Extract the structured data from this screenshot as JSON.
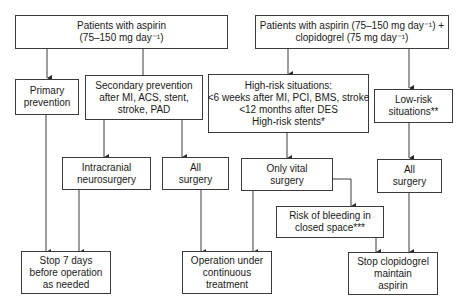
{
  "nodes": {
    "aspirin_root": {
      "lines": [
        "Patients with aspirin",
        "(75–150 mg day⁻¹)"
      ]
    },
    "primary_prevention": {
      "lines": [
        "Primary",
        "prevention"
      ]
    },
    "secondary_prevention": {
      "lines": [
        "Secondary prevention",
        "after MI, ACS, stent,",
        "stroke, PAD"
      ]
    },
    "intracranial": {
      "lines": [
        "Intracranial",
        "neurosurgery"
      ]
    },
    "all_surgery_left": {
      "lines": [
        "All",
        "surgery"
      ]
    },
    "stop_7_days": {
      "lines": [
        "Stop 7 days",
        "before operation",
        "as needed"
      ]
    },
    "operation_continuous": {
      "lines": [
        "Operation under",
        "continuous",
        "treatment"
      ]
    },
    "dual_root": {
      "lines": [
        "Patients with aspirin (75–150 mg day⁻¹) +",
        "clopidogrel (75 mg day⁻¹)"
      ]
    },
    "high_risk": {
      "lines": [
        "High-risk situations:",
        "<6 weeks after MI, PCI, BMS, stroke",
        "<12 months after DES",
        "High-risk stents*"
      ]
    },
    "low_risk": {
      "lines": [
        "Low-risk",
        "situations**"
      ]
    },
    "only_vital": {
      "lines": [
        "Only vital",
        "surgery"
      ]
    },
    "all_surgery_right": {
      "lines": [
        "All",
        "surgery"
      ]
    },
    "risk_bleeding": {
      "lines": [
        "Risk of bleeding in",
        "closed space***"
      ]
    },
    "stop_clopidogrel": {
      "lines": [
        "Stop clopidogrel",
        "maintain",
        "aspirin"
      ]
    }
  },
  "edges": [
    [
      "aspirin_root",
      "primary_prevention"
    ],
    [
      "aspirin_root",
      "secondary_prevention"
    ],
    [
      "secondary_prevention",
      "intracranial"
    ],
    [
      "secondary_prevention",
      "all_surgery_left"
    ],
    [
      "primary_prevention",
      "stop_7_days"
    ],
    [
      "intracranial",
      "stop_7_days"
    ],
    [
      "all_surgery_left",
      "operation_continuous"
    ],
    [
      "only_vital",
      "operation_continuous"
    ],
    [
      "dual_root",
      "high_risk"
    ],
    [
      "dual_root",
      "low_risk"
    ],
    [
      "high_risk",
      "only_vital"
    ],
    [
      "low_risk",
      "all_surgery_right"
    ],
    [
      "only_vital",
      "risk_bleeding"
    ],
    [
      "risk_bleeding",
      "stop_clopidogrel"
    ],
    [
      "all_surgery_right",
      "stop_clopidogrel"
    ]
  ]
}
